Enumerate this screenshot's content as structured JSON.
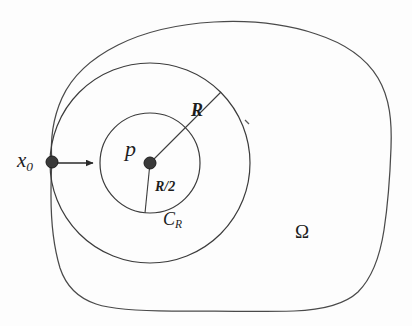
{
  "figure": {
    "kind": "geometry-diagram",
    "width": 412,
    "height": 326,
    "background_color": "#fdfdfd",
    "ink_color": "#2b2b2b",
    "label_color": "#1d1d1d"
  },
  "labels": {
    "x0": {
      "base": "x",
      "sub": "0"
    },
    "p": "p",
    "R": "R",
    "R_half": "R/2",
    "CR": {
      "base": "C",
      "sub": "R"
    },
    "omega": "Ω"
  },
  "geometry": {
    "center_point": {
      "name": "p",
      "x": 150,
      "y": 163,
      "dot_radius": 6
    },
    "boundary_point": {
      "name": "x0",
      "x": 52,
      "y": 162,
      "dot_radius": 6
    },
    "inner_circle": {
      "name": "ball-radius-R-over-2",
      "cx": 150,
      "cy": 163,
      "r": 50
    },
    "outer_circle": {
      "name": "ball-C-R",
      "cx": 150,
      "cy": 163,
      "r": 100
    },
    "radius_line_R": {
      "from_x": 150,
      "from_y": 163,
      "to_x": 221,
      "to_y": 92
    },
    "radius_line_R_half": {
      "from_x": 150,
      "from_y": 163,
      "to_x": 145,
      "to_y": 213
    },
    "arrow": {
      "from_x": 54,
      "from_y": 163,
      "to_x": 94,
      "to_y": 163
    },
    "tick_mark": {
      "x": 247,
      "y": 122
    },
    "domain_boundary_path": "M 52 162 C 50 140 53 118 62 98 C 72 76 92 58 118 45 C 146 31 180 24 214 22 C 250 20 286 24 316 34 C 344 43 366 58 378 78 C 390 98 392 122 391 148 C 390 176 388 204 384 230 C 380 256 372 278 358 292 C 344 305 322 310 294 311 C 258 312 214 311 172 311 C 140 311 114 310 96 304 C 78 298 66 286 60 268 C 54 248 51 222 51 196 C 51 182 51 172 52 162 Z"
  },
  "annotations": [
    {
      "name": "label-x0",
      "text_key": "x0",
      "x": 17,
      "y": 150
    },
    {
      "name": "label-p",
      "text_key": "p",
      "x": 125,
      "y": 138
    },
    {
      "name": "label-R",
      "text_key": "R",
      "x": 191,
      "y": 101
    },
    {
      "name": "label-R-half",
      "text_key": "R_half",
      "x": 155,
      "y": 180
    },
    {
      "name": "label-CR",
      "text_key": "CR",
      "x": 163,
      "y": 210
    },
    {
      "name": "label-omega",
      "text_key": "omega",
      "x": 295,
      "y": 222
    }
  ]
}
